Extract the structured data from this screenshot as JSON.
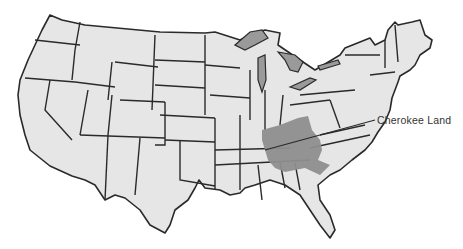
{
  "map": {
    "title": "United States",
    "annotation": {
      "label": "Cherokee Land"
    },
    "colors": {
      "land": "#e6e6e6",
      "border": "#2a2a2a",
      "highlight": "#8e8e8e",
      "lakes": "#9a9a9a"
    }
  }
}
